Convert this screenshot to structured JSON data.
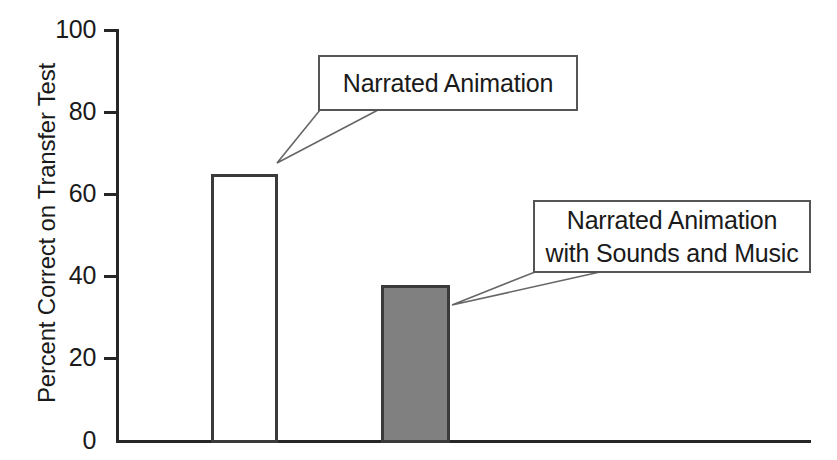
{
  "chart_data": {
    "type": "bar",
    "title": "",
    "subtitle": "",
    "xlabel": "",
    "ylabel": "Percent Correct on Transfer Test",
    "ylim": [
      0,
      100
    ],
    "ytick_labels": [
      "0",
      "20",
      "40",
      "60",
      "80",
      "100"
    ],
    "ytick_values": [
      0,
      20,
      40,
      60,
      80,
      100
    ],
    "xtick_labels": [],
    "grid": false,
    "legend_position": "none",
    "categories": [
      "Narrated Animation",
      "Narrated Animation with Sounds and Music"
    ],
    "values": [
      65,
      38
    ],
    "series": [
      {
        "name": "Percent Correct on Transfer Test",
        "values": [
          65,
          38
        ]
      }
    ],
    "bar_styles": [
      {
        "fill": "#ffffff",
        "stroke": "#3a3a3a",
        "label": "open-white-bar"
      },
      {
        "fill": "#808080",
        "stroke": "#3a3a3a",
        "label": "gray-filled-bar"
      }
    ],
    "annotations": [
      {
        "id": "callout-narrated-animation",
        "lines": [
          "Narrated Animation"
        ],
        "text": "Narrated Animation",
        "points_to_category": "Narrated Animation",
        "points_to_value": 65
      },
      {
        "id": "callout-narrated-animation-sounds-music",
        "lines": [
          "Narrated Animation",
          "with Sounds and Music"
        ],
        "text": "Narrated Animation with Sounds and Music",
        "points_to_category": "Narrated Animation with Sounds and Music",
        "points_to_value": 38
      }
    ]
  },
  "axis": {
    "y_title": "Percent Correct on Transfer Test",
    "ticks": [
      {
        "label": "100",
        "value": 100
      },
      {
        "label": "80",
        "value": 80
      },
      {
        "label": "60",
        "value": 60
      },
      {
        "label": "40",
        "value": 40
      },
      {
        "label": "20",
        "value": 20
      },
      {
        "label": "0",
        "value": 0
      }
    ]
  },
  "callouts": {
    "first": {
      "line1": "Narrated Animation"
    },
    "second": {
      "line1": "Narrated Animation",
      "line2": "with Sounds and Music"
    }
  },
  "colors": {
    "axis": "#262626",
    "bar_stroke": "#3a3a3a",
    "bar_open_fill": "#ffffff",
    "bar_filled_fill": "#808080",
    "callout_border": "#555555",
    "text": "#1a1a1a",
    "background": "#ffffff"
  }
}
